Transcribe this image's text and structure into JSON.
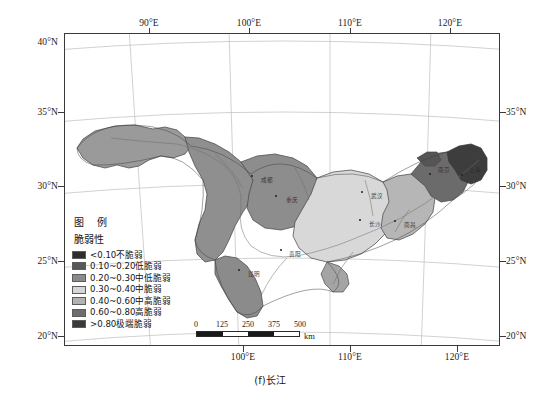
{
  "figure": {
    "caption": "(f)长江",
    "projection": "conic"
  },
  "axes": {
    "x_ticks_top": [
      {
        "label": "90°E",
        "x": 0.195
      },
      {
        "label": "100°E",
        "x": 0.425
      },
      {
        "label": "110°E",
        "x": 0.655
      },
      {
        "label": "120°E",
        "x": 0.885
      }
    ],
    "x_ticks_bottom": [
      {
        "label": "100°E",
        "x": 0.41
      },
      {
        "label": "110°E",
        "x": 0.655
      },
      {
        "label": "120°E",
        "x": 0.9
      }
    ],
    "y_ticks_left": [
      {
        "label": "40°N",
        "y": 0.03
      },
      {
        "label": "35°N",
        "y": 0.253
      },
      {
        "label": "30°N",
        "y": 0.49
      },
      {
        "label": "25°N",
        "y": 0.73
      },
      {
        "label": "20°N",
        "y": 0.968
      }
    ],
    "y_ticks_right": [
      {
        "label": "35°N",
        "y": 0.253
      },
      {
        "label": "30°N",
        "y": 0.49
      },
      {
        "label": "25°N",
        "y": 0.73
      },
      {
        "label": "20°N",
        "y": 0.968
      }
    ]
  },
  "legend": {
    "title": "图 例",
    "subtitle": "脆弱性",
    "items": [
      {
        "label": "<0.10不脆弱",
        "color": "#2e2e2e",
        "range": [
          null,
          0.1
        ]
      },
      {
        "label": "0.10~0.20低脆弱",
        "color": "#585858",
        "range": [
          0.1,
          0.2
        ]
      },
      {
        "label": "0.20~0.30中低脆弱",
        "color": "#8a8a8a",
        "range": [
          0.2,
          0.3
        ]
      },
      {
        "label": "0.30~0.40中脆弱",
        "color": "#d6d6d6",
        "range": [
          0.3,
          0.4
        ]
      },
      {
        "label": "0.40~0.60中高脆弱",
        "color": "#b2b2b2",
        "range": [
          0.4,
          0.6
        ]
      },
      {
        "label": "0.60~0.80高脆弱",
        "color": "#6e6e6e",
        "range": [
          0.6,
          0.8
        ]
      },
      {
        "label": ">0.80极端脆弱",
        "color": "#3a3a3a",
        "range": [
          0.8,
          null
        ]
      }
    ]
  },
  "scalebar": {
    "ticks": [
      "0",
      "125",
      "250",
      "375",
      "500"
    ],
    "unit": "km",
    "segments": [
      "dark",
      "light",
      "dark",
      "light"
    ]
  },
  "map": {
    "cities": [
      {
        "name": "成都",
        "x": 0.432,
        "y": 0.455
      },
      {
        "name": "重庆",
        "x": 0.487,
        "y": 0.52
      },
      {
        "name": "武汉",
        "x": 0.684,
        "y": 0.508
      },
      {
        "name": "长沙",
        "x": 0.68,
        "y": 0.597
      },
      {
        "name": "南昌",
        "x": 0.76,
        "y": 0.6
      },
      {
        "name": "南京",
        "x": 0.842,
        "y": 0.45
      },
      {
        "name": "上海",
        "x": 0.915,
        "y": 0.452
      },
      {
        "name": "昆明",
        "x": 0.402,
        "y": 0.76
      },
      {
        "name": "贵阳",
        "x": 0.497,
        "y": 0.695
      }
    ]
  },
  "colors": {
    "frame": "#3a3a3a",
    "graticule": "#b9b9b9",
    "outline": "#4a4a4a",
    "river": "#707070",
    "background": "#ffffff"
  }
}
